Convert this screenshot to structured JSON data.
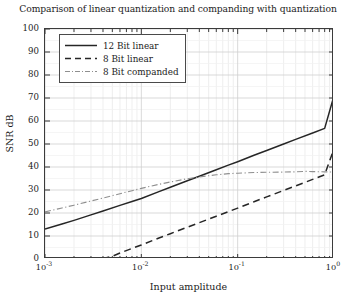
{
  "chart_data": {
    "type": "line",
    "title": "Comparison of linear quantization and companding with quantization",
    "xlabel": "Input amplitude",
    "ylabel": "SNR dB",
    "xscale": "log",
    "yscale": "linear",
    "xlim": [
      0.001,
      1
    ],
    "ylim": [
      0,
      100
    ],
    "grid": true,
    "grid_minor": true,
    "legend_position": "upper left",
    "ytick_labels": [
      "0",
      "10",
      "20",
      "30",
      "40",
      "50",
      "60",
      "70",
      "80",
      "90",
      "100"
    ],
    "ytick_values": [
      0,
      10,
      20,
      30,
      40,
      50,
      60,
      70,
      80,
      90,
      100
    ],
    "xtick_labels": [
      "10-3",
      "10-2",
      "10-1",
      "100"
    ],
    "xtick_mantissa": [
      "10",
      "10",
      "10",
      "10"
    ],
    "xtick_exponent": [
      "-3",
      "-2",
      "-1",
      "0"
    ],
    "xtick_values": [
      0.001,
      0.01,
      0.1,
      1
    ],
    "series": [
      {
        "name": "12 Bit linear",
        "style": "solid",
        "color": "#262626",
        "x": [
          0.001,
          0.0015,
          0.002,
          0.003,
          0.004,
          0.006,
          0.008,
          0.01,
          0.015,
          0.02,
          0.03,
          0.04,
          0.06,
          0.08,
          0.1,
          0.15,
          0.2,
          0.3,
          0.4,
          0.6,
          0.8,
          1.0
        ],
        "y": [
          13.0,
          15.2,
          16.8,
          19.2,
          20.9,
          23.3,
          25.0,
          26.3,
          29.2,
          31.2,
          34.0,
          36.0,
          38.8,
          40.8,
          42.3,
          45.2,
          47.2,
          50.0,
          52.0,
          54.8,
          56.8,
          71.0
        ]
      },
      {
        "name": "8 Bit linear",
        "style": "dashed",
        "color": "#262626",
        "x": [
          0.001,
          0.002,
          0.003,
          0.004,
          0.005,
          0.006,
          0.008,
          0.01,
          0.015,
          0.02,
          0.03,
          0.04,
          0.06,
          0.08,
          0.1,
          0.15,
          0.2,
          0.3,
          0.4,
          0.6,
          0.8,
          1.0
        ],
        "y": [
          0.0,
          0.0,
          0.0,
          0.2,
          1.2,
          2.6,
          4.6,
          6.1,
          9.0,
          11.0,
          13.8,
          15.8,
          18.6,
          20.6,
          22.1,
          25.0,
          27.0,
          29.8,
          31.8,
          34.6,
          36.6,
          48.0
        ]
      },
      {
        "name": "8 Bit companded",
        "style": "dashdot",
        "color": "#8f8f8f",
        "x": [
          0.001,
          0.0015,
          0.002,
          0.003,
          0.004,
          0.006,
          0.008,
          0.01,
          0.015,
          0.02,
          0.03,
          0.04,
          0.06,
          0.08,
          0.1,
          0.15,
          0.2,
          0.3,
          0.4,
          0.5,
          0.6,
          0.8,
          1.0
        ],
        "y": [
          20.5,
          22.2,
          23.4,
          25.2,
          26.5,
          28.4,
          29.7,
          30.7,
          32.4,
          33.5,
          34.9,
          35.7,
          36.6,
          37.1,
          37.3,
          37.6,
          37.7,
          37.8,
          37.9,
          38.1,
          38.0,
          37.9,
          37.8
        ]
      }
    ]
  },
  "legend": {
    "items": [
      {
        "label": "12 Bit linear",
        "style": "solid"
      },
      {
        "label": "8 Bit linear",
        "style": "dashed"
      },
      {
        "label": "8 Bit companded",
        "style": "dashdot"
      }
    ]
  }
}
